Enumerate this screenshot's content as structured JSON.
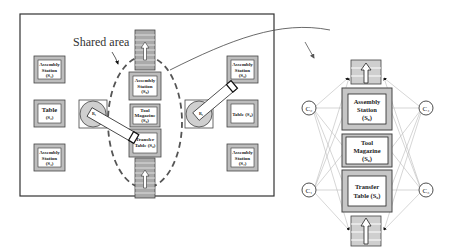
{
  "left_layout": {
    "shared_area_label": "Shared area",
    "left_stations": [
      {
        "name": "Assembly",
        "name2": "Station",
        "code": "(S₁)"
      },
      {
        "name": "Table",
        "name2": "",
        "code": "(S₂)"
      },
      {
        "name": "Assembly",
        "name2": "Station",
        "code": "(S₃)"
      }
    ],
    "center_stations": [
      {
        "name": "Assembly",
        "name2": "Station",
        "code": "(S₈)"
      },
      {
        "name": "Tool",
        "name2": "Magazine",
        "code": "(S₉)"
      },
      {
        "name": "Transfer",
        "name2": "Table (S₆)",
        "code": ""
      }
    ],
    "right_stations": [
      {
        "name": "Assembly",
        "name2": "Station",
        "code": "(S₅)"
      },
      {
        "name": "Table (S₄)",
        "name2": "",
        "code": ""
      },
      {
        "name": "Assembly",
        "name2": "Station",
        "code": "(S₇)"
      }
    ],
    "robots": [
      {
        "label": "R₁"
      },
      {
        "label": "R₂"
      }
    ]
  },
  "right_graph": {
    "nodes": [
      {
        "id": "C2",
        "label": "C₂"
      },
      {
        "id": "C4",
        "label": "C₄"
      },
      {
        "id": "C1",
        "label": "C₁"
      },
      {
        "id": "C3",
        "label": "C₃"
      }
    ],
    "resources": [
      {
        "name": "Assembly",
        "name2": "Station",
        "code": "(S₈)"
      },
      {
        "name": "Tool",
        "name2": "Magazine",
        "code": "(S₉)"
      },
      {
        "name": "Transfer",
        "name2": "Table (S₆)",
        "code": ""
      }
    ]
  }
}
